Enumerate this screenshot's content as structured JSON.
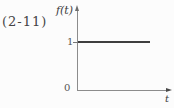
{
  "figure": {
    "equation_number": "(2-11)",
    "axis_label_y": "f(t)",
    "axis_label_x": "t",
    "tick_label_one": "1",
    "origin_label": "0"
  },
  "colors": {
    "background": "#fcfcfc",
    "axis": "#8c8c8c",
    "function_line": "#3f3f3f",
    "text": "#3b3b3b"
  },
  "chart_data": {
    "type": "line",
    "title": "",
    "xlabel": "t",
    "ylabel": "f(t)",
    "series": [
      {
        "name": "f(t)",
        "x": [
          0,
          3.2
        ],
        "values": [
          1,
          1
        ]
      }
    ],
    "xticks": [
      0
    ],
    "yticks": [
      1
    ],
    "xlim": [
      0,
      4.2
    ],
    "ylim": [
      0,
      1.6
    ],
    "grid": false,
    "legend": "none",
    "annotations": [
      "(2-11)"
    ]
  }
}
